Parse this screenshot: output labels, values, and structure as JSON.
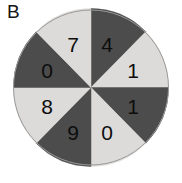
{
  "panel": {
    "label": "B"
  },
  "colors": {
    "background": "#ffffff",
    "dark_sector": "#4c4c4c",
    "light_sector": "#dddbd9",
    "label_text": "#0d0d0d",
    "outline": "#9a9a9a"
  },
  "chart_data": {
    "type": "pie",
    "title": "B",
    "xlabel": "",
    "ylabel": "",
    "grid": false,
    "legend": "none",
    "equal_sectors": true,
    "sector_count": 8,
    "sector_angle_degrees": 45,
    "start_angle_degrees": 0,
    "direction": "clockwise",
    "categories": [
      "4",
      "1",
      "1",
      "0",
      "9",
      "8",
      "0",
      "7"
    ],
    "values": [
      45,
      45,
      45,
      45,
      45,
      45,
      45,
      45
    ],
    "sectors": [
      {
        "index": 0,
        "label": "4",
        "fill": "dark",
        "color": "#4c4c4c",
        "start_deg": 0,
        "end_deg": 45,
        "mid_deg": 22.5,
        "lx": 94,
        "ly": 36
      },
      {
        "index": 1,
        "label": "1",
        "fill": "light",
        "color": "#dddbd9",
        "start_deg": 45,
        "end_deg": 90,
        "mid_deg": 67.5,
        "lx": 120,
        "ly": 62
      },
      {
        "index": 2,
        "label": "1",
        "fill": "dark",
        "color": "#4c4c4c",
        "start_deg": 90,
        "end_deg": 135,
        "mid_deg": 112.5,
        "lx": 120,
        "ly": 98
      },
      {
        "index": 3,
        "label": "0",
        "fill": "light",
        "color": "#dddbd9",
        "start_deg": 135,
        "end_deg": 180,
        "mid_deg": 157.5,
        "lx": 94,
        "ly": 124
      },
      {
        "index": 4,
        "label": "9",
        "fill": "dark",
        "color": "#4c4c4c",
        "start_deg": 180,
        "end_deg": 225,
        "mid_deg": 202.5,
        "lx": 60,
        "ly": 124
      },
      {
        "index": 5,
        "label": "8",
        "fill": "light",
        "color": "#dddbd9",
        "start_deg": 225,
        "end_deg": 270,
        "mid_deg": 247.5,
        "lx": 34,
        "ly": 98
      },
      {
        "index": 6,
        "label": "0",
        "fill": "dark",
        "color": "#4c4c4c",
        "start_deg": 270,
        "end_deg": 315,
        "mid_deg": 292.5,
        "lx": 34,
        "ly": 62
      },
      {
        "index": 7,
        "label": "7",
        "fill": "light",
        "color": "#dddbd9",
        "start_deg": 315,
        "end_deg": 360,
        "mid_deg": 337.5,
        "lx": 60,
        "ly": 36
      }
    ]
  }
}
